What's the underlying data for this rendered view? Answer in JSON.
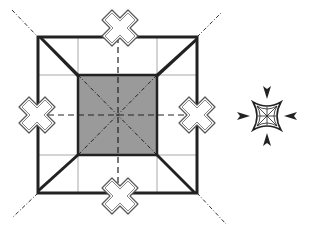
{
  "diagram": {
    "type": "origami-folding-diagram",
    "title": "",
    "colors": {
      "background": "#ffffff",
      "outline": "#222222",
      "inner_fill": "#9a9a9a",
      "grid_line": "#a8a8a8",
      "fold_line": "#222222",
      "symbol_outline": "#555555"
    },
    "outer_square": {
      "x": 38,
      "y": 37,
      "w": 159,
      "h": 156
    },
    "inner_square": {
      "x": 78,
      "y": 75,
      "w": 79,
      "h": 80
    },
    "center": {
      "x": 118,
      "y": 115
    },
    "fold_markers": [
      {
        "name": "top",
        "x": 120,
        "y": 28
      },
      {
        "name": "left",
        "x": 37,
        "y": 115
      },
      {
        "name": "right",
        "x": 197,
        "y": 115
      },
      {
        "name": "bottom",
        "x": 120,
        "y": 196
      }
    ],
    "result_symbol": {
      "x": 267,
      "y": 116,
      "label": ""
    }
  }
}
